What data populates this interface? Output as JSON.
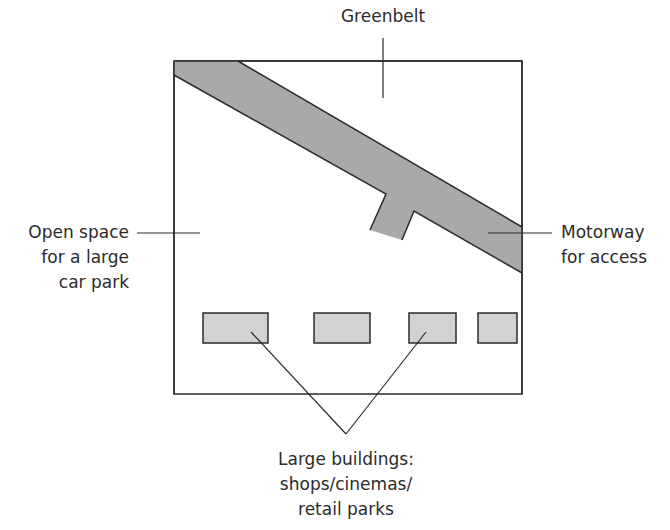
{
  "diagram": {
    "type": "site-plan",
    "colors": {
      "outline": "#2b2b2b",
      "motorway_fill": "#a9a9a9",
      "building_fill": "#d2d2d2",
      "background": "#ffffff"
    },
    "labels": {
      "greenbelt": [
        "Greenbelt"
      ],
      "open_space": [
        "Open space",
        "for a large",
        "car park"
      ],
      "motorway": [
        "Motorway",
        "for access"
      ],
      "buildings": [
        "Large buildings:",
        "shops/cinemas/",
        "retail parks"
      ]
    },
    "features": [
      {
        "name": "greenbelt",
        "kind": "surrounding land"
      },
      {
        "name": "motorway",
        "kind": "diagonal road with access spur"
      },
      {
        "name": "open-space",
        "kind": "car park area"
      },
      {
        "name": "buildings",
        "kind": "row of large buildings",
        "count": 4
      }
    ]
  }
}
